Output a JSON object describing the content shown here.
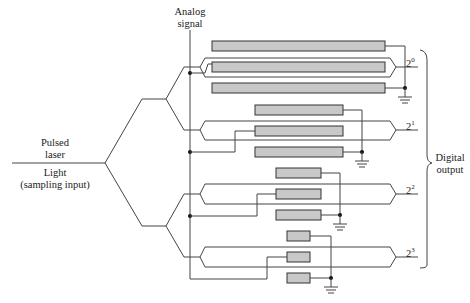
{
  "labels": {
    "analog_signal_line1": "Analog",
    "analog_signal_line2": "signal",
    "pulsed_laser_line1": "Pulsed",
    "pulsed_laser_line2": "laser",
    "light_line1": "Light",
    "light_line2": "(sampling input)",
    "digital_output_line1": "Digital",
    "digital_output_line2": "output"
  },
  "bits": [
    {
      "base": "2",
      "exp": "0"
    },
    {
      "base": "2",
      "exp": "1"
    },
    {
      "base": "2",
      "exp": "2"
    },
    {
      "base": "2",
      "exp": "3"
    }
  ],
  "colors": {
    "electrode_fill": "#c8c8c8",
    "line": "#444444",
    "background": "#ffffff"
  },
  "diagram": {
    "stages": 4
  }
}
